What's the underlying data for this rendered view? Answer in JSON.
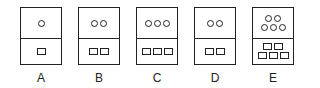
{
  "figure": {
    "panels": [
      {
        "label": "A",
        "circles": [
          1
        ],
        "squares": [
          1
        ],
        "left": 20
      },
      {
        "label": "B",
        "circles": [
          2
        ],
        "squares": [
          2
        ],
        "left": 78
      },
      {
        "label": "C",
        "circles": [
          3
        ],
        "squares": [
          3
        ],
        "left": 136
      },
      {
        "label": "D",
        "circles": [
          2
        ],
        "squares": [
          2
        ],
        "left": 194
      },
      {
        "label": "E",
        "circles": [
          2,
          3
        ],
        "squares": [
          2,
          3
        ],
        "left": 252
      }
    ]
  }
}
